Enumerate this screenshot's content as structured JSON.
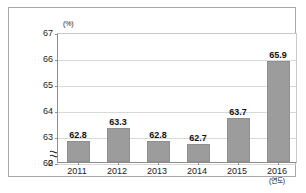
{
  "chart_data": {
    "type": "bar",
    "title": "",
    "subtitle": "",
    "xlabel": "(연도)",
    "ylabel": "(%)",
    "categories": [
      "2011",
      "2012",
      "2013",
      "2014",
      "2015",
      "2016"
    ],
    "values": [
      62.8,
      63.3,
      62.8,
      62.7,
      63.7,
      65.9
    ],
    "value_labels": [
      "62.8",
      "63.3",
      "62.8",
      "62.7",
      "63.7",
      "65.9"
    ],
    "series": [
      {
        "name": "",
        "values": [
          62.8,
          63.3,
          62.8,
          62.7,
          63.7,
          65.9
        ],
        "color": "#9c9c9c"
      }
    ],
    "ylim": [
      62,
      67
    ],
    "y_ticks": [
      "67",
      "66",
      "65",
      "64",
      "63",
      "62",
      "0"
    ],
    "y_tick_values": [
      67,
      66,
      65,
      64,
      63,
      62,
      0
    ],
    "axis_break": true,
    "axis_break_symbol": "≈",
    "grid": true,
    "grid_axis": "y",
    "legend": false,
    "legend_position": "none",
    "bar_color": "#9c9c9c",
    "grid_color": "#d9d9d9",
    "axis_color": "#8d8d8d",
    "background_color": "#ffffff"
  },
  "frame": {
    "border_color": "#a8a8a8"
  }
}
